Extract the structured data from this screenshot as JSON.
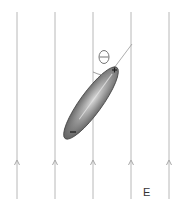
{
  "diagram": {
    "field": {
      "label": "E",
      "direction": "up",
      "line_count": 5,
      "line_x": [
        17,
        55,
        93,
        131,
        169
      ],
      "line_color": "#b8b8b8"
    },
    "dipole": {
      "positive_charge_label": "+",
      "negative_charge_label": "−",
      "body_color": "#777777",
      "highlight_color": "#d8d8d8"
    },
    "angle": {
      "label": "θ"
    }
  }
}
